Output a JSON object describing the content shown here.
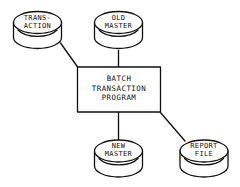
{
  "diagram": {
    "style": {
      "background": "#ffffff",
      "line_color": "#111111",
      "text_color": "#111111"
    },
    "process": {
      "name": "batch-transaction-program",
      "shape": "rectangle",
      "label_lines": [
        "BATCH",
        "TRANSACTION",
        "PROGRAM"
      ],
      "label_text": "BATCH\nTRANSACTION\nPROGRAM"
    },
    "stores": [
      {
        "name": "transaction-file",
        "shape": "cylinder",
        "label_lines": [
          "TRANS-",
          "ACTION"
        ],
        "label_text": "TRANS-\nACTION",
        "position": "top-left",
        "role": "input"
      },
      {
        "name": "old-master-file",
        "shape": "cylinder",
        "label_lines": [
          "OLD",
          "MASTER"
        ],
        "label_text": "OLD\nMASTER",
        "position": "top-center",
        "role": "input"
      },
      {
        "name": "new-master-file",
        "shape": "cylinder",
        "label_lines": [
          "NEW",
          "MASTER"
        ],
        "label_text": "NEW\nMASTER",
        "position": "bottom-center",
        "role": "output"
      },
      {
        "name": "report-file",
        "shape": "cylinder",
        "label_lines": [
          "REPORT",
          "FILE"
        ],
        "label_text": "REPORT\nFILE",
        "position": "bottom-right",
        "role": "output"
      }
    ],
    "connections": [
      {
        "name": "transaction-to-program",
        "from": "transaction-file",
        "to": "batch-transaction-program",
        "style": "diagonal"
      },
      {
        "name": "old-master-to-program",
        "from": "old-master-file",
        "to": "batch-transaction-program",
        "style": "vertical"
      },
      {
        "name": "program-to-new-master",
        "from": "batch-transaction-program",
        "to": "new-master-file",
        "style": "vertical"
      },
      {
        "name": "program-to-report",
        "from": "batch-transaction-program",
        "to": "report-file",
        "style": "diagonal"
      }
    ]
  }
}
